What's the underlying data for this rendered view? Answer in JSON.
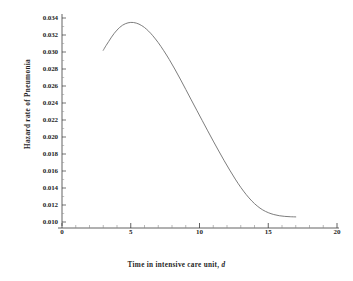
{
  "chart_data": {
    "type": "line",
    "title": "",
    "xlabel": "Time in intensive care unit, d",
    "xlabel_plain": "Time in intensive care unit,",
    "xlabel_italic": "d",
    "ylabel": "Hazard rate of Pneumonia",
    "xlim": [
      0,
      20
    ],
    "ylim": [
      0.01,
      0.034
    ],
    "xticks": [
      0,
      5,
      10,
      15,
      20
    ],
    "xtick_labels": [
      "0",
      "5",
      "10",
      "15",
      "20"
    ],
    "xminor_step": 1,
    "yticks": [
      0.01,
      0.012,
      0.014,
      0.016,
      0.018,
      0.02,
      0.022,
      0.024,
      0.026,
      0.028,
      0.03,
      0.032,
      0.034
    ],
    "ytick_labels": [
      "0.010",
      "0.012",
      "0.014",
      "0.016",
      "0.018",
      "0.020",
      "0.022",
      "0.024",
      "0.026",
      "0.028",
      "0.030",
      "0.032",
      "0.034"
    ],
    "grid": false,
    "legend": null,
    "line_color": "#6e6e6e",
    "axis_color": "#3a3a3a",
    "series": [
      {
        "name": "hazard rate",
        "x": [
          3.0,
          3.2,
          3.4,
          3.6,
          3.8,
          4.0,
          4.2,
          4.4,
          4.6,
          4.8,
          5.0,
          5.2,
          5.4,
          5.6,
          5.8,
          6.0,
          6.3,
          6.6,
          7.0,
          7.4,
          7.8,
          8.2,
          8.6,
          9.0,
          9.4,
          9.8,
          10.2,
          10.6,
          11.0,
          11.4,
          11.8,
          12.2,
          12.6,
          13.0,
          13.4,
          13.8,
          14.2,
          14.6,
          15.0,
          15.4,
          15.8,
          16.2,
          16.6,
          17.0
        ],
        "y": [
          0.0302,
          0.03075,
          0.03125,
          0.03175,
          0.0322,
          0.03258,
          0.0329,
          0.03315,
          0.03332,
          0.03343,
          0.03348,
          0.03347,
          0.0334,
          0.03328,
          0.0331,
          0.03288,
          0.03245,
          0.03192,
          0.0311,
          0.03015,
          0.02912,
          0.028,
          0.02682,
          0.0256,
          0.02437,
          0.02315,
          0.02193,
          0.02072,
          0.01952,
          0.01835,
          0.0172,
          0.0161,
          0.01505,
          0.01408,
          0.01322,
          0.01248,
          0.01188,
          0.01142,
          0.0111,
          0.01088,
          0.01074,
          0.01066,
          0.01062,
          0.0106
        ]
      }
    ]
  }
}
